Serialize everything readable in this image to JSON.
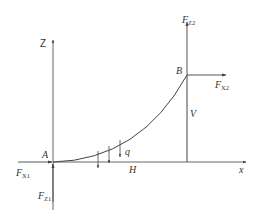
{
  "diagram": {
    "type": "cable-statics-free-body",
    "colors": {
      "line": "#444444",
      "text": "#333333",
      "background": "#ffffff"
    },
    "axes": {
      "vertical_label": "Z",
      "horizontal_label": "x"
    },
    "points": {
      "A": "A",
      "B": "B"
    },
    "forces": {
      "fz2": {
        "main": "F",
        "sub": "Z2"
      },
      "fx2": {
        "main": "F",
        "sub": "X2"
      },
      "fx1": {
        "main": "F",
        "sub": "X1"
      },
      "fz1": {
        "main": "F",
        "sub": "Z1"
      }
    },
    "dimensions": {
      "horizontal": "H",
      "vertical": "V"
    },
    "load": {
      "label": "q"
    }
  }
}
